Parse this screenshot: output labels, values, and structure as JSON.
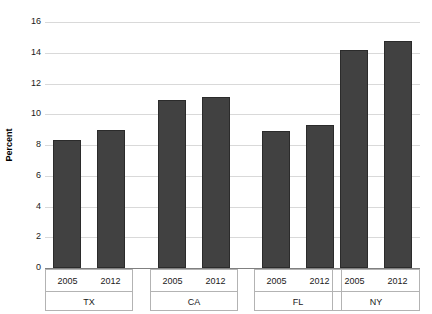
{
  "chart_data": {
    "type": "bar",
    "title": "",
    "xlabel": "",
    "ylabel": "Percent",
    "ylim": [
      0,
      16
    ],
    "yticks": [
      0,
      2,
      4,
      6,
      8,
      10,
      12,
      14,
      16
    ],
    "ytick_labels": [
      "0",
      "2",
      "4",
      "6",
      "8",
      "10",
      "12",
      "14",
      "16"
    ],
    "grid": true,
    "legend": "none",
    "categories": [
      "TX",
      "CA",
      "FL",
      "NY"
    ],
    "series": [
      {
        "name": "2005",
        "values": [
          8.3,
          10.9,
          8.9,
          14.2
        ]
      },
      {
        "name": "2012",
        "values": [
          9.0,
          11.15,
          9.3,
          14.75
        ]
      }
    ],
    "groups": [
      {
        "label": "TX",
        "bars": [
          {
            "year": "2005",
            "value": 8.3
          },
          {
            "year": "2012",
            "value": 9.0
          }
        ]
      },
      {
        "label": "CA",
        "bars": [
          {
            "year": "2005",
            "value": 10.9
          },
          {
            "year": "2012",
            "value": 11.15
          }
        ]
      },
      {
        "label": "FL",
        "bars": [
          {
            "year": "2005",
            "value": 8.9
          },
          {
            "year": "2012",
            "value": 9.3
          }
        ]
      },
      {
        "label": "NY",
        "bars": [
          {
            "year": "2005",
            "value": 14.2
          },
          {
            "year": "2012",
            "value": 14.75
          }
        ]
      }
    ],
    "colors": {
      "bar_fill": "#414141",
      "bar_edge": "#2b2b2b",
      "gridline": "#d9d9d9",
      "axis_line": "#808080",
      "table_border": "#b3b3b3",
      "background": "#ffffff",
      "text": "#1a1a1a"
    }
  }
}
